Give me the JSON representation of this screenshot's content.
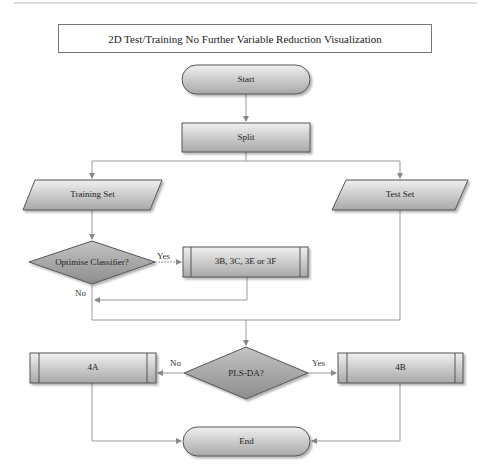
{
  "title": "2D Test/Training No Further Variable Reduction Visualization",
  "nodes": {
    "start": "Start",
    "split": "Split",
    "training_set": "Training Set",
    "test_set": "Test Set",
    "optimise": "Optimise Classifier?",
    "subprocess_3": "3B, 3C, 3E or 3F",
    "plsda": "PLS-DA?",
    "box_4a": "4A",
    "box_4b": "4B",
    "end": "End"
  },
  "edges": {
    "optimise_yes": "Yes",
    "optimise_no": "No",
    "plsda_no": "No",
    "plsda_yes": "Yes"
  },
  "colors": {
    "shape_light": "#ececec",
    "shape_dark": "#9a9a9a",
    "connector": "#9a9a9a",
    "outline": "#444444"
  }
}
